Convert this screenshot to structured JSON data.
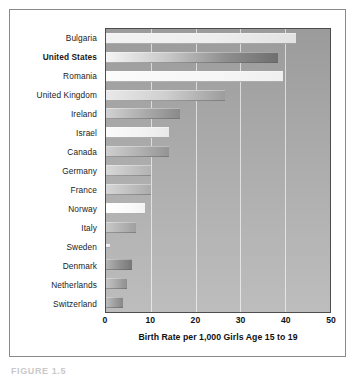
{
  "figure": {
    "caption": "FIGURE 1.5"
  },
  "chart_data": {
    "type": "bar",
    "orientation": "horizontal",
    "title": "",
    "subtitle": "",
    "xlabel": "Birth Rate per 1,000 Girls Age 15 to 19",
    "ylabel": "",
    "xlim": [
      0,
      50
    ],
    "xticks": [
      0,
      10,
      20,
      30,
      40,
      50
    ],
    "xtick_labels": [
      "0",
      "10",
      "20",
      "30",
      "40",
      "50"
    ],
    "grid": true,
    "gridlines_at": [
      10,
      20,
      30,
      40
    ],
    "legend": null,
    "legend_position": "none",
    "highlighted_category": "United States",
    "categories": [
      "Bulgaria",
      "United States",
      "Romania",
      "United Kingdom",
      "Ireland",
      "Israel",
      "Canada",
      "Germany",
      "France",
      "Norway",
      "Italy",
      "Sweden",
      "Denmark",
      "Netherlands",
      "Switzerland"
    ],
    "values": [
      42.5,
      38.5,
      39.5,
      26.5,
      16.5,
      14.0,
      14.0,
      10.0,
      10.0,
      8.6,
      6.6,
      1.0,
      5.7,
      4.6,
      3.8
    ],
    "bar_fills": [
      "linear-gradient(90deg,#f2f2f2 0%,#eeeeee 55%,#e2e2e2 100%)",
      "linear-gradient(90deg,#f4f4f4 0%,#c9c9c9 35%,#8e8e8e 70%,#6f6f6f 100%)",
      "linear-gradient(90deg,#fbfbfb 0%,#f6f6f6 60%,#efefef 100%)",
      "linear-gradient(90deg,#e9e9e9 0%,#cfcfcf 50%,#9d9d9d 100%)",
      "linear-gradient(90deg,#d2d2d2 0%,#a9a9a9 55%,#8a8a8a 100%)",
      "linear-gradient(90deg,#fafafa 0%,#f2f2f2 60%,#e8e8e8 100%)",
      "linear-gradient(90deg,#cfcfcf 0%,#b0b0b0 55%,#949494 100%)",
      "linear-gradient(90deg,#d8d8d8 0%,#c3c3c3 55%,#b2b2b2 100%)",
      "linear-gradient(90deg,#d6d6d6 0%,#bfbfbf 55%,#ababab 100%)",
      "linear-gradient(90deg,#ffffff 0%,#fafafa 60%,#f3f3f3 100%)",
      "linear-gradient(90deg,#c8c8c8 0%,#b2b2b2 55%,#9f9f9f 100%)",
      "linear-gradient(90deg,#efefef 0%,#e6e6e6 100%)",
      "linear-gradient(90deg,#b4b4b4 0%,#8f8f8f 55%,#777777 100%)",
      "linear-gradient(90deg,#c4c4c4 0%,#a7a7a7 55%,#8f8f8f 100%)",
      "linear-gradient(90deg,#bcbcbc 0%,#9d9d9d 55%,#878787 100%)"
    ],
    "colors": {
      "plot_background": "#a8a8a8",
      "plot_border": "#4d4d4d",
      "figure_background": "#ffffff",
      "figure_border": "#8a8a8a",
      "gridline": "#ffffff",
      "text": "#1b1b1b"
    }
  }
}
